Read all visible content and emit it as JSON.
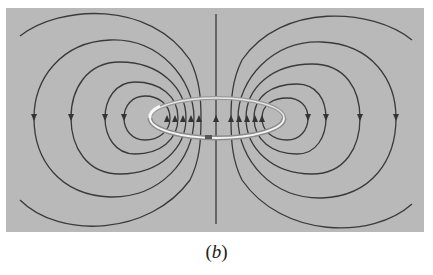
{
  "figure": {
    "caption_open": "(",
    "caption_letter": "b",
    "caption_close": ")",
    "colors": {
      "panel": "#b9b9b9",
      "field_line": "#3a3a3a",
      "ring_light": "#f2f2f2",
      "ring_dark": "#8a8a8a"
    }
  }
}
